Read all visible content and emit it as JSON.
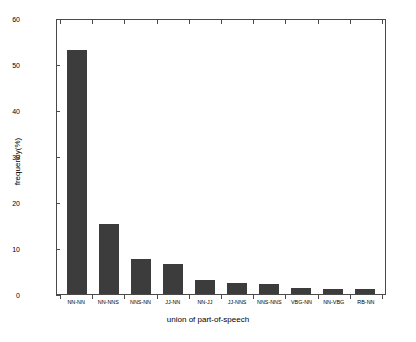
{
  "chart_data": {
    "type": "bar",
    "title": "",
    "xlabel": "union of part-of-speech",
    "ylabel": "frequency(%)",
    "categories": [
      "NN-NN",
      "NN-NNS",
      "NNS-NN",
      "JJ-NN",
      "NN-JJ",
      "JJ-NNS",
      "NNS-NNS",
      "VBG-NN",
      "NN-VBG",
      "RB-NN"
    ],
    "values": [
      53.5,
      15.3,
      7.6,
      6.6,
      3.0,
      2.4,
      2.2,
      1.4,
      1.2,
      1.0
    ],
    "ylim": [
      0,
      60
    ],
    "yticks": [
      0,
      10,
      20,
      30,
      40,
      50,
      60
    ],
    "ytick_labels": [
      "0",
      "10",
      "20",
      "30",
      "40",
      "50",
      "60"
    ],
    "grid": false,
    "legend": null,
    "bar_color": "#3c3c3c",
    "axis_color": "#4a4a4a",
    "background": "#ffffff"
  }
}
